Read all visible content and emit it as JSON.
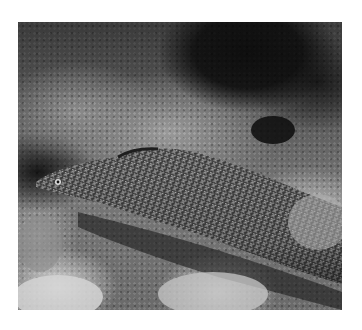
{
  "image": {
    "subject": "spotted moray eel among reef rocks",
    "tone": "grayscale",
    "alt": "Moray eel with white reticulated pattern resting on coral reef"
  },
  "colors": {
    "background": "#ffffff",
    "eel_base": "#3c3c3c",
    "eel_spots": "#e6e6e6",
    "shadow": "#0e0e0e"
  }
}
